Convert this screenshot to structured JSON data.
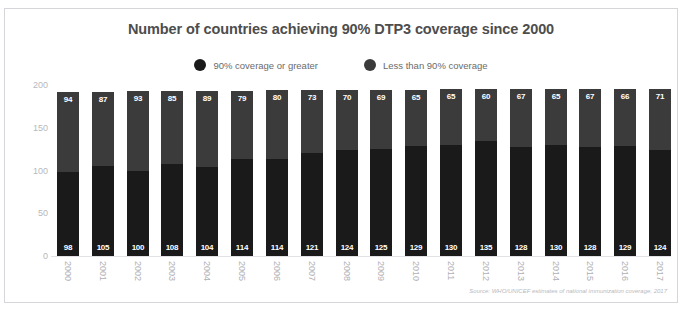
{
  "cutoff_text": "",
  "card": {
    "title": "Number of countries achieving 90% DTP3 coverage since 2000",
    "source": "Source: WHO/UNICEF estimates of national immunization coverage, 2017"
  },
  "legend": {
    "items": [
      {
        "label": "90% coverage or greater",
        "color": "#1a1a1a"
      },
      {
        "label": "Less than 90% coverage",
        "color": "#3b3b3b"
      }
    ]
  },
  "colors": {
    "at_or_above_90": "#1a1a1a",
    "below_90": "#3b3b3b",
    "title": "#4d4d4d",
    "tick": "#b8b8bc",
    "border": "#d6d6da"
  },
  "chart_data": {
    "type": "bar",
    "subtype": "stacked-column",
    "title": "Number of countries achieving 90% DTP3 coverage since 2000",
    "xlabel": "",
    "ylabel": "",
    "ylim": [
      0,
      200
    ],
    "yticks": [
      0,
      50,
      100,
      150,
      200
    ],
    "ytick_labels": [
      "0",
      "50",
      "100",
      "150",
      "200"
    ],
    "grid": false,
    "legend_position": "top-center",
    "categories": [
      "2000",
      "2001",
      "2002",
      "2003",
      "2004",
      "2005",
      "2006",
      "2007",
      "2008",
      "2009",
      "2010",
      "2011",
      "2012",
      "2013",
      "2014",
      "2015",
      "2016",
      "2017"
    ],
    "series": [
      {
        "name": "90% coverage or greater",
        "color": "#1a1a1a",
        "stack_position": "bottom",
        "values": [
          98,
          105,
          100,
          108,
          104,
          114,
          114,
          121,
          124,
          125,
          129,
          130,
          135,
          128,
          130,
          128,
          129,
          124
        ]
      },
      {
        "name": "Less than 90% coverage",
        "color": "#3b3b3b",
        "stack_position": "top",
        "values": [
          94,
          87,
          93,
          85,
          89,
          79,
          80,
          73,
          70,
          69,
          65,
          65,
          60,
          67,
          65,
          67,
          66,
          71
        ]
      }
    ],
    "totals": [
      192,
      192,
      193,
      193,
      193,
      193,
      194,
      194,
      194,
      194,
      194,
      195,
      195,
      195,
      195,
      195,
      195,
      195
    ],
    "annotations": [
      "Source: WHO/UNICEF estimates of national immunization coverage, 2017"
    ]
  }
}
